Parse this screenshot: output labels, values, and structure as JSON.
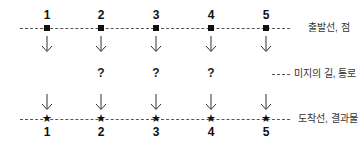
{
  "diagram": {
    "columns": [
      "1",
      "2",
      "3",
      "4",
      "5"
    ],
    "unknown_marks": [
      "?",
      "?",
      "?"
    ],
    "top_row": {
      "marker": "square",
      "label": "출발선, 점"
    },
    "middle_row": {
      "label": "미지의 길, 통로"
    },
    "bottom_row": {
      "marker": "star",
      "label": "도착선, 결과물"
    },
    "star_glyph": "★",
    "arrow_glyph": "down-arrow"
  }
}
